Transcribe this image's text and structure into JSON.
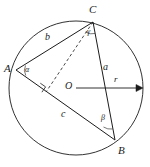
{
  "figure": {
    "background_color": "#ffffff",
    "stroke_color": "#1b1b1b",
    "width": 150,
    "height": 167
  },
  "circle": {
    "name": "circumcircle",
    "center_x": 76,
    "center_y": 88,
    "radius": 67
  },
  "center": {
    "label": "O",
    "x": 76,
    "y": 88,
    "label_x": 65,
    "label_y": 83
  },
  "vertices": [
    {
      "label": "A",
      "x": 16,
      "y": 70,
      "label_x": 4,
      "label_y": 64
    },
    {
      "label": "C",
      "x": 93,
      "y": 22,
      "label_x": 89,
      "label_y": 5
    },
    {
      "label": "B",
      "x": 115,
      "y": 140,
      "label_x": 118,
      "label_y": 146
    }
  ],
  "sides": [
    {
      "label": "b",
      "from": "A",
      "to": "C",
      "label_x": 45,
      "label_y": 33
    },
    {
      "label": "a",
      "from": "C",
      "to": "B",
      "label_x": 103,
      "label_y": 63
    },
    {
      "label": "c",
      "from": "A",
      "to": "B",
      "label_x": 61,
      "label_y": 110
    }
  ],
  "angles": [
    {
      "label": "α",
      "at": "A",
      "label_x": 25,
      "label_y": 68
    },
    {
      "label": "γ",
      "at": "C",
      "label_x": 87,
      "label_y": 31
    },
    {
      "label": "β",
      "at": "B",
      "label_x": 101,
      "label_y": 117
    }
  ],
  "radius": {
    "label": "r",
    "from_x": 76,
    "from_y": 88,
    "to_x": 143,
    "to_y": 88,
    "label_x": 114,
    "label_y": 76,
    "arrowhead": true
  },
  "dashed_segment": {
    "name": "altitude-from-C",
    "from_x": 93,
    "from_y": 22,
    "to_x": 46,
    "to_y": 92,
    "style": "dashed"
  },
  "right_angle_marker": {
    "name": "right-angle-mark",
    "x": 43,
    "y": 86,
    "size": 7
  }
}
